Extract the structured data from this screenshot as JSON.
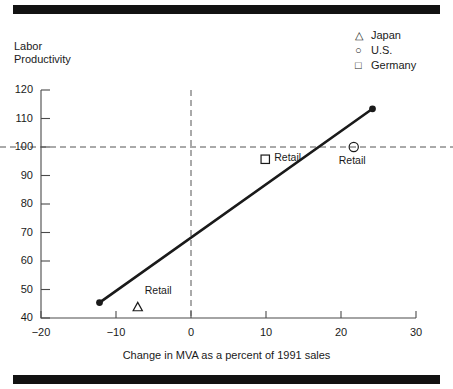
{
  "figure": {
    "ylabel": "Labor\nProductivity",
    "xlabel": "Change in MVA as a percent of 1991 sales"
  },
  "legend": {
    "position": "top-right",
    "items": [
      {
        "marker": "triangle",
        "glyph": "△",
        "label": "Japan"
      },
      {
        "marker": "circle",
        "glyph": "○",
        "label": "U.S."
      },
      {
        "marker": "square",
        "glyph": "□",
        "label": "Germany"
      }
    ]
  },
  "annotations": {
    "japan_retail": "Retail",
    "germany_retail": "Retail",
    "us_retail": "Retail"
  },
  "chart_data": {
    "type": "scatter",
    "title": "",
    "xlabel": "Change in MVA as a percent of 1991 sales",
    "ylabel": "Labor Productivity",
    "xlim": [
      -20,
      30
    ],
    "ylim": [
      40,
      120
    ],
    "xticks": [
      -20,
      -10,
      0,
      10,
      20,
      30
    ],
    "xtick_labels": [
      "−20",
      "−10",
      "0",
      "10",
      "20",
      "30"
    ],
    "yticks": [
      40,
      50,
      60,
      70,
      80,
      90,
      100,
      110,
      120
    ],
    "ytick_labels": [
      "40",
      "50",
      "60",
      "70",
      "80",
      "90",
      "100",
      "110",
      "120"
    ],
    "grid": false,
    "reference_lines": [
      {
        "orient": "horizontal",
        "value": 100,
        "style": "dashed"
      },
      {
        "orient": "vertical",
        "value": 0,
        "style": "dashed"
      }
    ],
    "series": [
      {
        "name": "Trend line",
        "type": "line",
        "style": "solid",
        "endpoint_markers": "filled-circle",
        "points": [
          {
            "x": -12.2,
            "y": 45.4
          },
          {
            "x": 24.2,
            "y": 113.4
          }
        ]
      },
      {
        "name": "Japan",
        "marker": "triangle",
        "glyph": "△",
        "points": [
          {
            "x": -7.1,
            "y": 43.8,
            "label": "Retail"
          }
        ]
      },
      {
        "name": "Germany",
        "marker": "square",
        "glyph": "□",
        "points": [
          {
            "x": 9.9,
            "y": 95.7,
            "label": "Retail"
          }
        ]
      },
      {
        "name": "U.S.",
        "marker": "circle",
        "glyph": "○",
        "points": [
          {
            "x": 21.7,
            "y": 100.0,
            "label": "Retail"
          }
        ]
      }
    ]
  }
}
